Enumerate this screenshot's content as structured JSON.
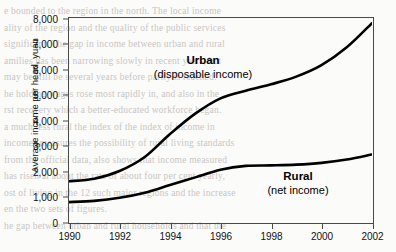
{
  "figure": {
    "background_bleed_lines": [
      "e bounded to the region in the north. The local income",
      "ality of the region and the quality of the public services",
      "significant. The gap in income between urban and rural",
      "amilies has been narrowing slowly in recent years, but",
      "may be still be several years before parity is reached.",
      "he holding wages rose most rapidly in, and also in the",
      "rst recovery which a better-educated workforce began.",
      "a much less rural the index of the index of income in",
      "incomes measures the possibility of rural living standards",
      "from the official data, also shows that income measured",
      "has risen at about the rate of about four per cent yearly,",
      "ost of living in the 12 such major regions and the increase",
      "en the two sets of figures.",
      "he gap between urban and rural households and that the"
    ]
  },
  "chart_data": {
    "type": "line",
    "title": "",
    "xlabel": "",
    "ylabel": "Average income per head, yuan",
    "xlim": [
      1990,
      2002
    ],
    "ylim": [
      0,
      8000
    ],
    "grid": false,
    "legend": "inline-annotations",
    "x_ticks": [
      "1990",
      "1992",
      "1994",
      "1996",
      "1998",
      "2000",
      "2002"
    ],
    "x_tick_values": [
      1990,
      1992,
      1994,
      1996,
      1998,
      2000,
      2002
    ],
    "y_ticks": [
      "0",
      "1,000",
      "2,000",
      "3,000",
      "4,000",
      "5,000",
      "6,000",
      "7,000",
      "8,000"
    ],
    "y_tick_values": [
      0,
      1000,
      2000,
      3000,
      4000,
      5000,
      6000,
      7000,
      8000
    ],
    "x": [
      1990,
      1991,
      1992,
      1993,
      1994,
      1995,
      1996,
      1997,
      1998,
      1999,
      2000,
      2001,
      2002
    ],
    "series": [
      {
        "name": "Urban",
        "sublabel": "(disposable income)",
        "color": "#000000",
        "values": [
          1600,
          1700,
          2000,
          2550,
          3450,
          4250,
          4850,
          5150,
          5400,
          5700,
          6150,
          6850,
          7800
        ]
      },
      {
        "name": "Rural",
        "sublabel": "(net income)",
        "color": "#000000",
        "values": [
          780,
          830,
          950,
          1150,
          1450,
          1750,
          2050,
          2200,
          2220,
          2250,
          2320,
          2450,
          2650
        ]
      }
    ]
  }
}
